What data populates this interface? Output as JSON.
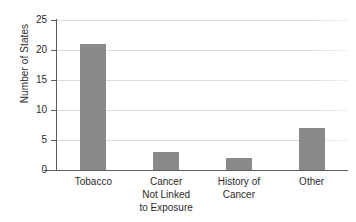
{
  "chart_data": {
    "type": "bar",
    "title": "",
    "xlabel": "",
    "ylabel": "Number of States",
    "categories": [
      "Tobacco",
      "Cancer Not Linked to Exposure",
      "History of Cancer",
      "Other"
    ],
    "category_lines": [
      [
        "Tobacco"
      ],
      [
        "Cancer",
        "Not Linked",
        "to Exposure"
      ],
      [
        "History of",
        "Cancer"
      ],
      [
        "Other"
      ]
    ],
    "values": [
      21,
      3,
      2,
      7
    ],
    "ylim": [
      0,
      25
    ],
    "yticks": [
      0,
      5,
      10,
      15,
      20,
      25
    ],
    "ytick_labels": [
      "0",
      "5",
      "10",
      "15",
      "20",
      "25"
    ],
    "grid": true,
    "legend": false,
    "bar_color": "#8a8a8a",
    "gridline_color": "#dcdcdc",
    "axis_color": "#5d5d5d",
    "text_color": "#2b2b2b",
    "background_color": "#ffffff"
  }
}
